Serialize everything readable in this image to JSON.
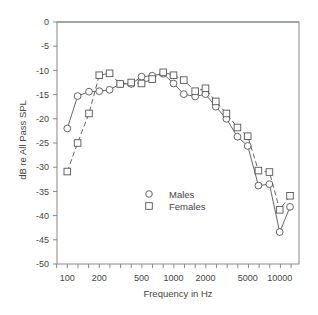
{
  "chart_data": {
    "type": "line",
    "title": "",
    "xlabel": "Frequency in Hz",
    "ylabel": "dB re All Pass SPL",
    "xscale": "log",
    "xlim": [
      85,
      14500
    ],
    "ylim": [
      -50,
      0
    ],
    "grid": false,
    "legend_position": "lower-center inside",
    "x_tick_labels": [
      "100",
      "200",
      "500",
      "1000",
      "2000",
      "5000",
      "10000"
    ],
    "x_tick_values": [
      100,
      200,
      500,
      1000,
      2000,
      5000,
      10000
    ],
    "y_tick_labels": [
      "0",
      "-5",
      "-10",
      "-15",
      "-20",
      "-25",
      "-30",
      "-35",
      "-40",
      "-45",
      "-50"
    ],
    "y_tick_values": [
      0,
      -5,
      -10,
      -15,
      -20,
      -25,
      -30,
      -35,
      -40,
      -45,
      -50
    ],
    "x": [
      100,
      125,
      160,
      200,
      250,
      315,
      400,
      500,
      630,
      800,
      1000,
      1250,
      1600,
      2000,
      2500,
      3150,
      4000,
      5000,
      6300,
      8000,
      10000,
      12500
    ],
    "series": [
      {
        "name": "Males",
        "marker": "circle",
        "line": "solid",
        "values": [
          -22.0,
          -15.3,
          -14.4,
          -14.3,
          -14.0,
          -12.8,
          -12.8,
          -11.3,
          -11.1,
          -10.7,
          -12.7,
          -14.9,
          -15.4,
          -14.9,
          -17.5,
          -20.0,
          -23.7,
          -25.6,
          -33.8,
          -33.5,
          -43.4,
          -38.2
        ]
      },
      {
        "name": "Females",
        "marker": "square",
        "line": "dashed",
        "values": [
          -30.9,
          -25.0,
          -18.9,
          -11.0,
          -10.6,
          -12.8,
          -12.5,
          -12.7,
          -11.8,
          -10.4,
          -11.0,
          -12.0,
          -14.3,
          -13.7,
          -16.4,
          -18.9,
          -21.8,
          -23.6,
          -30.7,
          -31.0,
          -38.8,
          -35.9
        ]
      }
    ]
  },
  "legend": {
    "items": [
      {
        "label": "Males",
        "marker": "circle-icon"
      },
      {
        "label": "Females",
        "marker": "square-icon"
      }
    ]
  },
  "colors": {
    "axis": "#777777",
    "series": "#555555",
    "marker_fill": "#ffffff",
    "text": "#444444"
  }
}
